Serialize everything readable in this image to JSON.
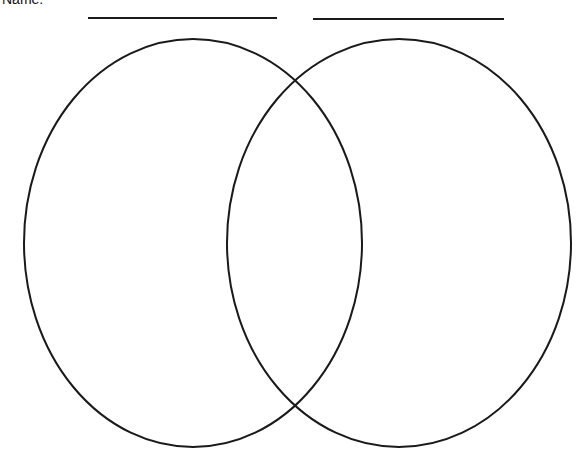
{
  "diagram": {
    "type": "venn",
    "header_text_cut": "Name:",
    "left_label": "",
    "right_label": "",
    "stroke_color": "#1a1a1a",
    "background": "#ffffff",
    "left_line": {
      "x1": 88,
      "x2": 277,
      "y": 18
    },
    "right_line": {
      "x1": 313,
      "x2": 504,
      "y": 19
    },
    "left_circle": {
      "cx": 193,
      "cy": 243,
      "rx": 169,
      "ry": 204
    },
    "right_circle": {
      "cx": 399,
      "cy": 243,
      "rx": 172,
      "ry": 204
    }
  }
}
